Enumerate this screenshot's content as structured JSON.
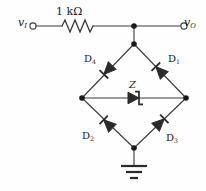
{
  "figure": {
    "line_color": "#3a3a3a",
    "node_color": "#1a1a1a",
    "background": "#fefefe"
  },
  "labels": {
    "input_terminal": "v",
    "input_terminal_sub": "I",
    "output_terminal": "v",
    "output_terminal_sub": "O",
    "resistor": "1 kΩ",
    "diode1": "D",
    "diode1_sub": "1",
    "diode2": "D",
    "diode2_sub": "2",
    "diode3": "D",
    "diode3_sub": "3",
    "diode4": "D",
    "diode4_sub": "4",
    "zener": "Z"
  },
  "components": [
    {
      "name": "resistor",
      "value": "1 kΩ",
      "type": "resistor"
    },
    {
      "name": "diode1",
      "value": "D1",
      "type": "diode"
    },
    {
      "name": "diode2",
      "value": "D2",
      "type": "diode"
    },
    {
      "name": "diode3",
      "value": "D3",
      "type": "diode"
    },
    {
      "name": "diode4",
      "value": "D4",
      "type": "diode"
    },
    {
      "name": "zener",
      "value": "Z",
      "type": "zener-diode"
    },
    {
      "name": "ground",
      "value": "",
      "type": "ground"
    }
  ],
  "terminals": [
    {
      "name": "input",
      "label": "vI"
    },
    {
      "name": "output",
      "label": "vO"
    }
  ]
}
